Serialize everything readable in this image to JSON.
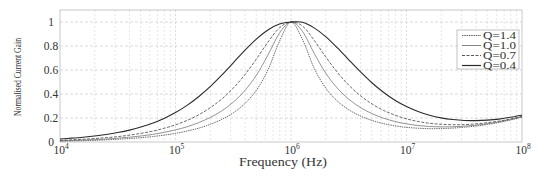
{
  "chart_data": {
    "type": "line",
    "title": "",
    "xlabel": "Frequency (Hz)",
    "ylabel": "Normalised Current Gain",
    "xscale": "log",
    "xlim_log10": [
      4,
      8
    ],
    "ylim": [
      0,
      1.1
    ],
    "grid": true,
    "legend_position": "upper right",
    "x_ticks": [
      {
        "log10": 4,
        "base": "10",
        "exp": "4"
      },
      {
        "log10": 5,
        "base": "10",
        "exp": "5"
      },
      {
        "log10": 6,
        "base": "10",
        "exp": "6"
      },
      {
        "log10": 7,
        "base": "10",
        "exp": "7"
      },
      {
        "log10": 8,
        "base": "10",
        "exp": "8"
      }
    ],
    "y_ticks": [
      {
        "value": 0,
        "label": "0"
      },
      {
        "value": 0.2,
        "label": "0.2"
      },
      {
        "value": 0.4,
        "label": "0.4"
      },
      {
        "value": 0.6,
        "label": "0.6"
      },
      {
        "value": 0.8,
        "label": "0.8"
      },
      {
        "value": 1.0,
        "label": "1"
      }
    ],
    "x_log10": [
      4.0,
      4.1,
      4.2,
      4.3,
      4.4,
      4.5,
      4.6,
      4.7,
      4.8,
      4.9,
      5.0,
      5.1,
      5.2,
      5.3,
      5.4,
      5.5,
      5.6,
      5.7,
      5.8,
      5.9,
      6.0,
      6.1,
      6.2,
      6.3,
      6.4,
      6.5,
      6.6,
      6.7,
      6.8,
      6.9,
      7.0,
      7.1,
      7.2,
      7.3,
      7.4,
      7.5,
      7.6,
      7.7,
      7.8,
      7.9,
      8.0
    ],
    "series": [
      {
        "name": "Q=1.4",
        "style": "dotted",
        "color": "#444444",
        "values": [
          0.007,
          0.009,
          0.011,
          0.014,
          0.018,
          0.023,
          0.029,
          0.036,
          0.045,
          0.057,
          0.072,
          0.091,
          0.115,
          0.147,
          0.188,
          0.243,
          0.32,
          0.431,
          0.599,
          0.838,
          1.0,
          0.853,
          0.616,
          0.45,
          0.342,
          0.269,
          0.217,
          0.18,
          0.153,
          0.135,
          0.122,
          0.115,
          0.111,
          0.112,
          0.116,
          0.123,
          0.133,
          0.146,
          0.163,
          0.183,
          0.207
        ]
      },
      {
        "name": "Q=1.0",
        "style": "solid-thin",
        "color": "#666666",
        "values": [
          0.01,
          0.013,
          0.016,
          0.02,
          0.025,
          0.032,
          0.04,
          0.05,
          0.063,
          0.08,
          0.101,
          0.127,
          0.161,
          0.204,
          0.259,
          0.332,
          0.428,
          0.556,
          0.724,
          0.907,
          1.0,
          0.921,
          0.74,
          0.575,
          0.45,
          0.357,
          0.288,
          0.237,
          0.199,
          0.171,
          0.151,
          0.137,
          0.129,
          0.126,
          0.127,
          0.132,
          0.14,
          0.152,
          0.168,
          0.187,
          0.21
        ]
      },
      {
        "name": "Q=0.7",
        "style": "dashed",
        "color": "#444444",
        "values": [
          0.014,
          0.018,
          0.023,
          0.029,
          0.036,
          0.045,
          0.057,
          0.072,
          0.09,
          0.114,
          0.143,
          0.18,
          0.226,
          0.285,
          0.358,
          0.449,
          0.56,
          0.691,
          0.832,
          0.951,
          1.0,
          0.966,
          0.848,
          0.71,
          0.582,
          0.474,
          0.387,
          0.318,
          0.264,
          0.224,
          0.193,
          0.171,
          0.156,
          0.148,
          0.144,
          0.145,
          0.151,
          0.161,
          0.174,
          0.192,
          0.214
        ]
      },
      {
        "name": "Q=0.4",
        "style": "solid",
        "color": "#2a2a2a",
        "values": [
          0.025,
          0.032,
          0.04,
          0.05,
          0.063,
          0.079,
          0.099,
          0.125,
          0.156,
          0.196,
          0.245,
          0.305,
          0.377,
          0.461,
          0.557,
          0.66,
          0.764,
          0.858,
          0.934,
          0.983,
          1.0,
          0.998,
          0.951,
          0.878,
          0.786,
          0.685,
          0.586,
          0.494,
          0.415,
          0.348,
          0.295,
          0.254,
          0.223,
          0.201,
          0.187,
          0.179,
          0.178,
          0.182,
          0.191,
          0.206,
          0.225
        ]
      }
    ],
    "colors": {
      "grid": "#cccccc",
      "frame": "#bbbbbb",
      "legend_border": "#999999",
      "text": "#333333",
      "background": "#ffffff"
    }
  }
}
